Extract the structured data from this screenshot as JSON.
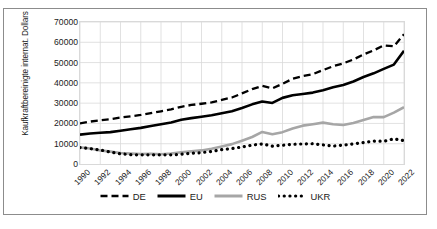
{
  "chart_data": {
    "type": "line",
    "title": "",
    "xlabel": "",
    "ylabel": "Kaufkraftbereinigte internat. Dollars",
    "ylim": [
      0,
      70000
    ],
    "ytick_values": [
      0,
      10000,
      20000,
      30000,
      40000,
      50000,
      60000,
      70000
    ],
    "ytick_labels": [
      "0",
      "10000",
      "20000",
      "30000",
      "40000",
      "50000",
      "60000",
      "70000"
    ],
    "grid": true,
    "legend_position": "bottom",
    "x": [
      1990,
      1991,
      1992,
      1993,
      1994,
      1995,
      1996,
      1997,
      1998,
      1999,
      2000,
      2001,
      2002,
      2003,
      2004,
      2005,
      2006,
      2007,
      2008,
      2009,
      2010,
      2011,
      2012,
      2013,
      2014,
      2015,
      2016,
      2017,
      2018,
      2019,
      2020,
      2021,
      2022
    ],
    "xtick_labels": [
      "1990",
      "1992",
      "1994",
      "1996",
      "1998",
      "2000",
      "2002",
      "2004",
      "2006",
      "2008",
      "2010",
      "2012",
      "2014",
      "2016",
      "2018",
      "2020",
      "2022"
    ],
    "series": [
      {
        "name": "DE",
        "style": "dashed",
        "color": "#000000",
        "values": [
          20000,
          20900,
          21600,
          22100,
          22900,
          23500,
          24200,
          25100,
          26000,
          26900,
          28200,
          29100,
          29700,
          30400,
          31600,
          32800,
          34800,
          36900,
          38500,
          37300,
          39500,
          42000,
          43300,
          44300,
          46300,
          48200,
          49600,
          51500,
          54000,
          56000,
          58500,
          58000,
          64000
        ]
      },
      {
        "name": "EU",
        "style": "solid",
        "color": "#000000",
        "values": [
          14500,
          15000,
          15400,
          15700,
          16400,
          17100,
          17800,
          18700,
          19600,
          20500,
          21800,
          22600,
          23300,
          24000,
          25000,
          26000,
          27600,
          29400,
          30800,
          30100,
          32600,
          33900,
          34500,
          35200,
          36400,
          37800,
          38900,
          40700,
          42900,
          44700,
          46900,
          49000,
          55800
        ]
      },
      {
        "name": "RUS",
        "style": "solid",
        "color": "#a6a6a6",
        "values": [
          8200,
          7600,
          6700,
          6100,
          5400,
          5100,
          4900,
          5000,
          4800,
          5200,
          5800,
          6200,
          6700,
          7500,
          8600,
          9800,
          11500,
          13300,
          15800,
          14700,
          15700,
          17500,
          18900,
          19600,
          20400,
          19600,
          19200,
          20200,
          21700,
          23200,
          23100,
          25300,
          28000
        ]
      },
      {
        "name": "UKR",
        "style": "dotted",
        "color": "#000000",
        "values": [
          8100,
          7600,
          6900,
          5900,
          5000,
          4600,
          4500,
          4500,
          4500,
          4500,
          4800,
          5300,
          5600,
          6200,
          7100,
          7600,
          8400,
          9300,
          9900,
          8800,
          9200,
          9700,
          9900,
          10000,
          9400,
          8800,
          9300,
          9900,
          10600,
          11300,
          11200,
          12400,
          11500
        ]
      }
    ]
  },
  "legend": {
    "items": [
      {
        "label": "DE"
      },
      {
        "label": "EU"
      },
      {
        "label": "RUS"
      },
      {
        "label": "UKR"
      }
    ]
  }
}
